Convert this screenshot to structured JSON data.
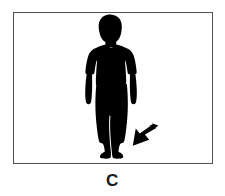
{
  "figure": {
    "panel_label": "C",
    "frame": {
      "border_color": "#4f4f4f",
      "background_color": "#ffffff",
      "x": 13,
      "y": 12,
      "width": 200,
      "height": 152
    },
    "silhouette": {
      "name": "standing-child-silhouette",
      "color": "#000000",
      "description": "Front-facing black silhouette of a standing child wearing a short-sleeved shirt and long pants, arms hanging at the sides",
      "bbox": {
        "x": 84,
        "y": 24,
        "width": 46,
        "height": 128
      }
    },
    "annotation_arrow": {
      "name": "feet-pointer-arrow",
      "color": "#000000",
      "direction": "down-left",
      "tail": {
        "x": 153,
        "y": 126
      },
      "tip": {
        "x": 122,
        "y": 146
      },
      "points_at": "feet"
    },
    "label_color": "#1a1a1a",
    "canvas": {
      "width": 225,
      "height": 196,
      "background_color": "#ffffff"
    }
  }
}
